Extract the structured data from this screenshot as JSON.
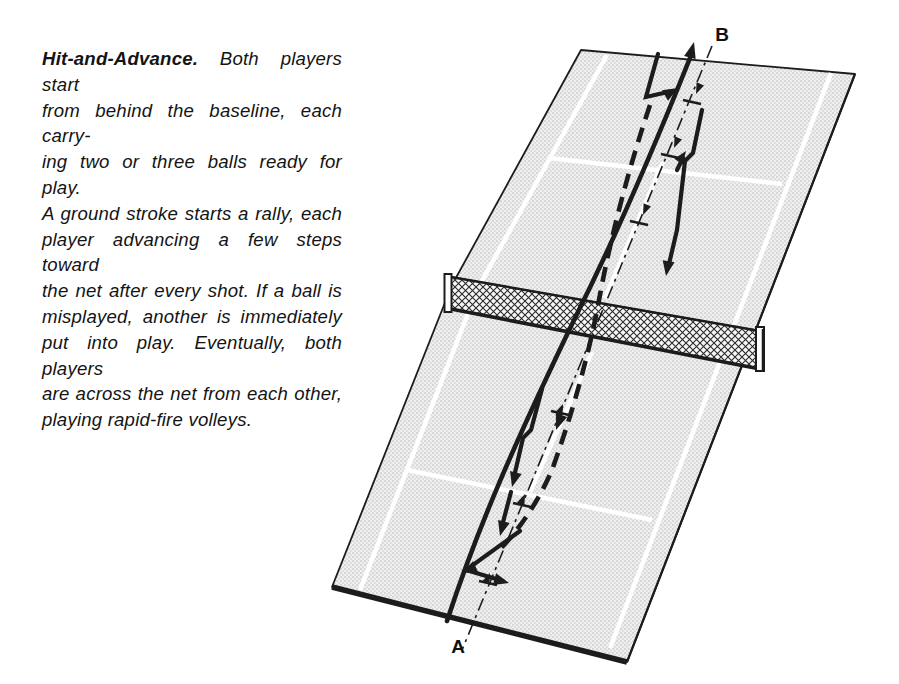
{
  "caption": {
    "title": "Hit-and-Advance.",
    "line1_rest": "Both players start",
    "lines": [
      "from behind the baseline, each carry-",
      "ing two or three balls ready for play.",
      "A ground stroke starts a rally, each",
      "player advancing a few steps toward",
      "the net after every shot. If a ball is",
      "misplayed, another is immediately",
      "put into play. Eventually, both players",
      "are across the net from each other,",
      "playing rapid-fire volleys."
    ]
  },
  "diagram": {
    "label_a": "A",
    "label_b": "B",
    "colors": {
      "ink": "#1c1c1c",
      "court_dot_texture": "#b5b5b5",
      "court_background": "#efefef",
      "court_painted_line": "#ffffff",
      "net_mesh": "#2a2a2a"
    }
  }
}
